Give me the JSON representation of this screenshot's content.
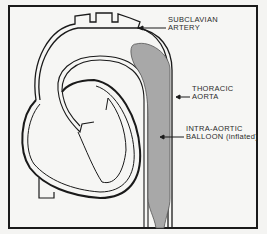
{
  "diagram": {
    "labels": {
      "subclavian_line1": "SUBCLAVIAN",
      "subclavian_line2": "ARTERY",
      "thoracic_line1": "THORACIC",
      "thoracic_line2": "AORTA",
      "balloon_line1": "INTRA-AORTIC",
      "balloon_line2": "BALLOON (inflated)"
    },
    "colors": {
      "outline": "#1a1a1a",
      "balloon_fill": "#a8a8a8",
      "background": "#f6f6f4"
    }
  }
}
